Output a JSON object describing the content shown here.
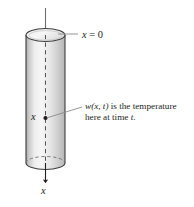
{
  "figure": {
    "background_color": "#ffffff",
    "ink_color": "#231f20",
    "cylinder_fill_light": "#f2f2f2",
    "cylinder_fill_mid": "#d9d9d9",
    "cylinder_fill_dark": "#b9b9b9"
  },
  "labels": {
    "top_axis": {
      "var": "x",
      "rest": " = 0"
    },
    "mid_point": "x",
    "bottom_axis": "x",
    "annotation": {
      "line1_pre": "w",
      "line1_args": "(x, t)",
      "line1_post": " is the temperature",
      "line2": "here at time ",
      "line2_var": "t",
      "line2_end": "."
    }
  },
  "caption": {
    "text": ""
  },
  "geometry": {
    "axis_top_y": 8,
    "axis_bottom_y": 183,
    "cylinder_left_x": 26,
    "cylinder_right_x": 65,
    "cylinder_top_y": 35,
    "cylinder_bottom_y": 163,
    "ellipse_rx": 19.5,
    "ellipse_ry": 6.5,
    "point_x": 45,
    "point_y": 118
  }
}
